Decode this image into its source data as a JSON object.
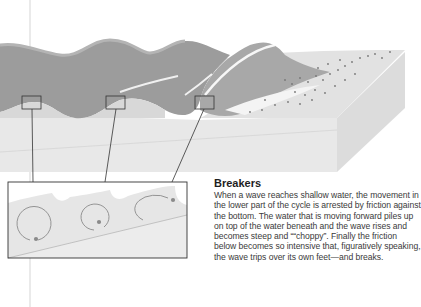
{
  "caption": {
    "title": "Breakers",
    "body": "When a wave reaches shallow water, the movement in the lower part of the cycle is arrested by friction against the bottom. The water that is moving forward piles up on top of the water beneath and the wave rises and becomes steep and ““choppy”. Finally the friction below becomes so intensive that, figuratively speaking, the wave trips over its own feet—and breaks."
  },
  "diagram": {
    "callout_boxes": 3,
    "inset_orbits": [
      "circular-orbit",
      "flattened-orbit",
      "breaking-orbit"
    ],
    "colors": {
      "wave": "#9a9a9a",
      "water_light": "#dcdcdc",
      "block_front": "#e9e9e9",
      "block_side": "#dedede",
      "outline": "#333333"
    }
  }
}
